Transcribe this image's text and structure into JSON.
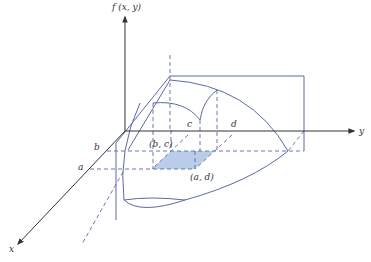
{
  "diagram": {
    "axes": {
      "vertical": "f (x, y)",
      "horizontal": "y",
      "depth": "x"
    },
    "tick_labels": {
      "a": "a",
      "b": "b",
      "c": "c",
      "d": "d"
    },
    "points": {
      "bc": "(b, c)",
      "ad": "(a, d)"
    },
    "colors": {
      "axis": "#333333",
      "surface": "#5a6aa8",
      "dashed": "#5a6aa8",
      "shaded_region": "#b9cde8"
    }
  }
}
